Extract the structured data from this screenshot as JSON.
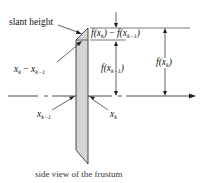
{
  "diagram": {
    "caption": "side view of the frustum",
    "labels": {
      "slant_height": "slant height",
      "delta_x": {
        "a": "x",
        "a_sub": "k",
        "minus": " − ",
        "b": "x",
        "b_sub": "k−1"
      },
      "delta_f": {
        "f1": "f(x",
        "f1_sub": "k",
        "close1": ")",
        "minus": " − ",
        "f2": "f(x",
        "f2_sub": "k−1",
        "close2": ")"
      },
      "f_xk_minus_1": {
        "f": "f(x",
        "sub": "k−1",
        "close": ")"
      },
      "f_xk": {
        "f": "f(x",
        "sub": "k",
        "close": ")"
      },
      "x_k_minus_1": {
        "x": "x",
        "sub": "k−1"
      },
      "x_k": {
        "x": "x",
        "sub": "k"
      }
    },
    "colors": {
      "line": "#222222",
      "frustum_fill": "#d4d4d4",
      "background": "#ffffff"
    }
  }
}
